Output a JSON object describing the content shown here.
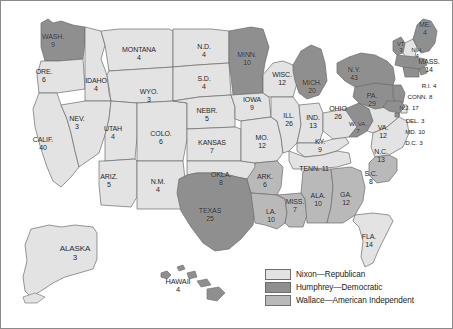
{
  "figure": {
    "kind": "electoral-map",
    "region": "United States"
  },
  "colors": {
    "nixon": "#e3e3e3",
    "humphrey": "#8f8f8f",
    "wallace": "#b9b9b9",
    "stroke": "#6b6b6b",
    "outline": "#4a4a4a",
    "label": "#1b1b1b",
    "background": "#ffffff",
    "frame": "#8a8a8a"
  },
  "legend": {
    "items": [
      {
        "key": "nixon",
        "label": "Nixon—Republican",
        "swatch": "#e3e3e3"
      },
      {
        "key": "humphrey",
        "label": "Humphrey—Democratic",
        "swatch": "#8f8f8f"
      },
      {
        "key": "wallace",
        "label": "Wallace—American Independent",
        "swatch": "#b9b9b9"
      }
    ]
  },
  "chart_data": {
    "type": "map",
    "title": "",
    "categories": [
      "Nixon—Republican",
      "Humphrey—Democratic",
      "Wallace—American Independent"
    ],
    "value_label": "Electoral votes",
    "states": [
      {
        "id": "WA",
        "name": "WASH.",
        "ev": 9,
        "winner": "humphrey",
        "x": 52,
        "y": 40,
        "size": ""
      },
      {
        "id": "OR",
        "name": "ORE.",
        "ev": 6,
        "winner": "nixon",
        "x": 43,
        "y": 75,
        "size": ""
      },
      {
        "id": "CA",
        "name": "CALIF.",
        "ev": 40,
        "winner": "nixon",
        "x": 42,
        "y": 143,
        "size": ""
      },
      {
        "id": "ID",
        "name": "IDAHO",
        "ev": 4,
        "winner": "nixon",
        "x": 95,
        "y": 84,
        "size": ""
      },
      {
        "id": "NV",
        "name": "NEV.",
        "ev": 3,
        "winner": "nixon",
        "x": 76,
        "y": 122,
        "size": ""
      },
      {
        "id": "MT",
        "name": "MONTANA",
        "ev": 4,
        "winner": "nixon",
        "x": 138,
        "y": 53,
        "size": ""
      },
      {
        "id": "WY",
        "name": "WYO.",
        "ev": 3,
        "winner": "nixon",
        "x": 148,
        "y": 95,
        "size": ""
      },
      {
        "id": "UT",
        "name": "UTAH",
        "ev": 4,
        "winner": "nixon",
        "x": 112,
        "y": 132,
        "size": ""
      },
      {
        "id": "CO",
        "name": "COLO.",
        "ev": 6,
        "winner": "nixon",
        "x": 160,
        "y": 137,
        "size": ""
      },
      {
        "id": "AZ",
        "name": "ARIZ.",
        "ev": 5,
        "winner": "nixon",
        "x": 108,
        "y": 180,
        "size": ""
      },
      {
        "id": "NM",
        "name": "N.M.",
        "ev": 4,
        "winner": "nixon",
        "x": 157,
        "y": 185,
        "size": ""
      },
      {
        "id": "ND",
        "name": "N.D.",
        "ev": 4,
        "winner": "nixon",
        "x": 203,
        "y": 50,
        "size": ""
      },
      {
        "id": "SD",
        "name": "S.D.",
        "ev": 4,
        "winner": "nixon",
        "x": 203,
        "y": 82,
        "size": ""
      },
      {
        "id": "NE",
        "name": "NEBR.",
        "ev": 5,
        "winner": "nixon",
        "x": 206,
        "y": 114,
        "size": ""
      },
      {
        "id": "KS",
        "name": "KANSAS",
        "ev": 7,
        "winner": "nixon",
        "x": 211,
        "y": 146,
        "size": ""
      },
      {
        "id": "OK",
        "name": "OKLA.",
        "ev": 8,
        "winner": "nixon",
        "x": 220,
        "y": 178,
        "size": ""
      },
      {
        "id": "TX",
        "name": "TEXAS",
        "ev": 25,
        "winner": "humphrey",
        "x": 209,
        "y": 214,
        "size": ""
      },
      {
        "id": "MN",
        "name": "MINN.",
        "ev": 10,
        "winner": "humphrey",
        "x": 246,
        "y": 58,
        "size": ""
      },
      {
        "id": "IA",
        "name": "IOWA",
        "ev": 9,
        "winner": "nixon",
        "x": 251,
        "y": 103,
        "size": ""
      },
      {
        "id": "MO",
        "name": "MO.",
        "ev": 12,
        "winner": "nixon",
        "x": 261,
        "y": 141,
        "size": ""
      },
      {
        "id": "AR",
        "name": "ARK.",
        "ev": 6,
        "winner": "wallace",
        "x": 264,
        "y": 180,
        "size": ""
      },
      {
        "id": "LA",
        "name": "LA.",
        "ev": 10,
        "winner": "wallace",
        "x": 270,
        "y": 215,
        "size": ""
      },
      {
        "id": "WI",
        "name": "WISC.",
        "ev": 12,
        "winner": "nixon",
        "x": 281,
        "y": 78,
        "size": ""
      },
      {
        "id": "IL",
        "name": "ILL.",
        "ev": 26,
        "winner": "nixon",
        "x": 288,
        "y": 119,
        "size": ""
      },
      {
        "id": "MS",
        "name": "MISS.",
        "ev": 7,
        "winner": "wallace",
        "x": 294,
        "y": 205,
        "size": ""
      },
      {
        "id": "MI",
        "name": "MICH.",
        "ev": 20,
        "winner": "humphrey",
        "x": 311,
        "y": 86,
        "size": ""
      },
      {
        "id": "IN",
        "name": "IND.",
        "ev": 13,
        "winner": "nixon",
        "x": 312,
        "y": 121,
        "size": ""
      },
      {
        "id": "KY",
        "name": "KY.",
        "ev": 9,
        "winner": "nixon",
        "x": 319,
        "y": 145,
        "size": ""
      },
      {
        "id": "TN",
        "name": "TENN.",
        "ev": 11,
        "winner": "nixon",
        "x": 313,
        "y": 168,
        "size": "inline"
      },
      {
        "id": "AL",
        "name": "ALA.",
        "ev": 10,
        "winner": "wallace",
        "x": 317,
        "y": 199,
        "size": ""
      },
      {
        "id": "GA",
        "name": "GA.",
        "ev": 12,
        "winner": "wallace",
        "x": 345,
        "y": 198,
        "size": ""
      },
      {
        "id": "FL",
        "name": "FLA.",
        "ev": 14,
        "winner": "nixon",
        "x": 368,
        "y": 240,
        "size": ""
      },
      {
        "id": "OH",
        "name": "OHIO",
        "ev": 26,
        "winner": "nixon",
        "x": 337,
        "y": 112,
        "size": ""
      },
      {
        "id": "WV",
        "name": "W. VA.",
        "ev": 7,
        "winner": "humphrey",
        "x": 357,
        "y": 127,
        "size": "sm"
      },
      {
        "id": "VA",
        "name": "VA.",
        "ev": 12,
        "winner": "nixon",
        "x": 382,
        "y": 131,
        "size": ""
      },
      {
        "id": "NC",
        "name": "N.C.",
        "ev": 13,
        "winner": "nixon",
        "x": 380,
        "y": 155,
        "size": ""
      },
      {
        "id": "SC",
        "name": "S.C.",
        "ev": 8,
        "winner": "wallace",
        "x": 370,
        "y": 177,
        "size": ""
      },
      {
        "id": "PA",
        "name": "PA.",
        "ev": 29,
        "winner": "humphrey",
        "x": 371,
        "y": 99,
        "size": ""
      },
      {
        "id": "NY",
        "name": "N.Y.",
        "ev": 43,
        "winner": "humphrey",
        "x": 353,
        "y": 73,
        "size": ""
      },
      {
        "id": "VT",
        "name": "VT.",
        "ev": 3,
        "winner": "humphrey",
        "x": 400,
        "y": 46,
        "size": "tiny"
      },
      {
        "id": "NH",
        "name": "N.H.",
        "ev": 4,
        "winner": "nixon",
        "x": 416,
        "y": 52,
        "size": "tiny"
      },
      {
        "id": "ME",
        "name": "ME.",
        "ev": 4,
        "winner": "humphrey",
        "x": 424,
        "y": 28,
        "size": ""
      },
      {
        "id": "MA",
        "name": "MASS.",
        "ev": 14,
        "winner": "humphrey",
        "x": 428,
        "y": 65,
        "size": ""
      },
      {
        "id": "RI",
        "name": "R.I.",
        "ev": 4,
        "winner": "humphrey",
        "x": 428,
        "y": 85,
        "size": "inline sm"
      },
      {
        "id": "CT",
        "name": "CONN.",
        "ev": 8,
        "winner": "humphrey",
        "x": 419,
        "y": 96,
        "size": "inline sm"
      },
      {
        "id": "NJ",
        "name": "N.J.",
        "ev": 17,
        "winner": "humphrey",
        "x": 408,
        "y": 107,
        "size": "inline sm"
      },
      {
        "id": "DE",
        "name": "DEL.",
        "ev": 3,
        "winner": "nixon",
        "x": 414,
        "y": 120,
        "size": "inline sm"
      },
      {
        "id": "MD",
        "name": "MD.",
        "ev": 10,
        "winner": "humphrey",
        "x": 414,
        "y": 131,
        "size": "inline sm"
      },
      {
        "id": "DC",
        "name": "D.C.",
        "ev": 3,
        "winner": "humphrey",
        "x": 413,
        "y": 142,
        "size": "inline sm"
      },
      {
        "id": "AK",
        "name": "ALASKA",
        "ev": 3,
        "winner": "nixon",
        "x": 74,
        "y": 253,
        "size": "ak"
      },
      {
        "id": "HI",
        "name": "HAWAII",
        "ev": 4,
        "winner": "humphrey",
        "x": 177,
        "y": 285,
        "size": "hi"
      }
    ]
  }
}
